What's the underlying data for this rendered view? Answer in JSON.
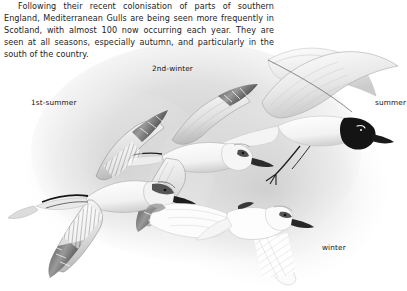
{
  "page": {
    "background_color": "#ffffff",
    "text_color": "#1d1d1d",
    "wash_color": "#d8d8d8"
  },
  "intro": {
    "paragraph": "Following their recent colonisation of parts of southern England, Mediterranean Gulls are being seen more frequently in Scotland, with almost 100 now occurring each year. They are seen at all seasons, especially autumn, and particularly in the south of the country.",
    "lines": [
      "Following their recent colonisation of parts of southern England,",
      "Mediterranean Gulls are being seen more frequently in Scotland,",
      "with almost 100 now occurring each year. They are seen at all",
      "seasons, especially autumn, and particularly in the south of",
      "the country."
    ]
  },
  "plate": {
    "subject": "Mediterranean Gull",
    "medium": "pencil illustration, greyscale",
    "captions": [
      {
        "id": "first-summer",
        "label": "1st-summer"
      },
      {
        "id": "second-winter",
        "label": "2nd-winter"
      },
      {
        "id": "summer",
        "label": "summer"
      },
      {
        "id": "winter",
        "label": "winter"
      }
    ],
    "birds": [
      {
        "id": "first-summer",
        "caption": "1st-summer",
        "description": "gull in flight, dark-tipped upperwing with dark carpal bar and black primaries, dark smudge behind eye"
      },
      {
        "id": "second-winter",
        "caption": "2nd-winter",
        "description": "gull in flight, pale grey upperwing with limited black on outer primaries, dark eye mask"
      },
      {
        "id": "summer",
        "caption": "summer",
        "description": "adult in flight, full black hood, white wings with no black, red bill and legs rendered dark"
      },
      {
        "id": "winter",
        "caption": "winter",
        "description": "adult in flight seen from below, white wings, dark eye mask, pale head"
      }
    ]
  }
}
